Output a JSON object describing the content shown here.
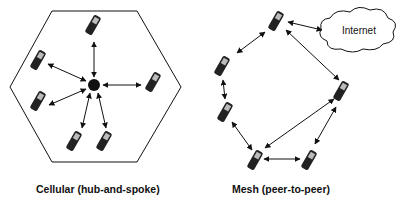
{
  "diagrams": [
    {
      "caption": "Cellular (hub-and-spoke)",
      "topology": "hub-and-spoke",
      "hub": "base-station",
      "node_count": 6,
      "boundary": "hexagon"
    },
    {
      "caption": "Mesh (peer-to-peer)",
      "topology": "peer-to-peer",
      "node_count": 6,
      "cloud_label": "Internet"
    }
  ],
  "colors": {
    "stroke": "#111111",
    "background": "#ffffff",
    "phone_body": "#222222",
    "phone_screen": "#bbbbbb"
  }
}
